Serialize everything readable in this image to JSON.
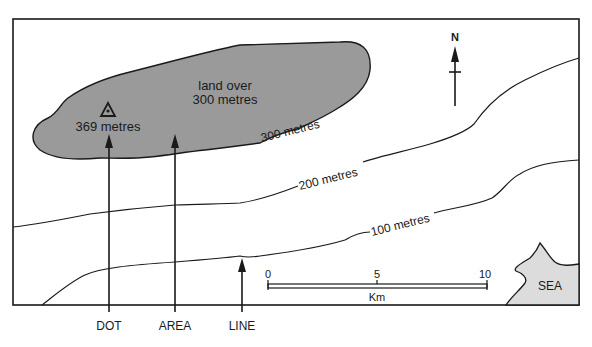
{
  "diagram": {
    "type": "topographic-map-relief-methods",
    "summit": {
      "symbol": "triangle-dot",
      "label": "369 metres"
    },
    "shaded_area": {
      "label_line1": "land over",
      "label_line2": "300 metres",
      "fill": "#9a9a9a"
    },
    "contours": [
      {
        "label": "300 metres"
      },
      {
        "label": "200 metres"
      },
      {
        "label": "100 metres"
      }
    ],
    "north_arrow": {
      "label": "N"
    },
    "scale_bar": {
      "ticks": [
        "0",
        "5",
        "10"
      ],
      "unit": "Km"
    },
    "sea": {
      "label": "SEA",
      "fill": "#dcdcdc"
    },
    "method_labels": [
      {
        "label": "DOT"
      },
      {
        "label": "AREA"
      },
      {
        "label": "LINE"
      }
    ]
  }
}
